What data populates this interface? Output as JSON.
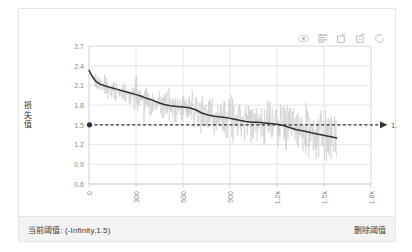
{
  "footer": {
    "threshold_label": "当前阈值: (-Infinity,1.5)",
    "delete_action": "删除阈值"
  },
  "toolbox": {
    "icons": [
      {
        "name": "data-zoom-eye-icon",
        "title": "区域缩放"
      },
      {
        "name": "data-view-icon",
        "title": "数据视图"
      },
      {
        "name": "zoom-in-box-icon",
        "title": "区域缩放"
      },
      {
        "name": "zoom-out-box-icon",
        "title": "区域缩放还原"
      },
      {
        "name": "restore-icon",
        "title": "还原"
      }
    ]
  },
  "chart_data": {
    "type": "line",
    "title": "",
    "xlabel": "",
    "ylabel": "损失值",
    "xlim": [
      0,
      1800
    ],
    "ylim": [
      0.6,
      2.7
    ],
    "grid": true,
    "legend_position": "none",
    "y_ticks": [
      "0.6",
      "0.9",
      "1.2",
      "1.5",
      "1.8",
      "2.1",
      "2.4",
      "2.7"
    ],
    "y_tick_values": [
      0.6,
      0.9,
      1.2,
      1.5,
      1.8,
      2.1,
      2.4,
      2.7
    ],
    "x_ticks": [
      "0",
      "300",
      "600",
      "900",
      "1.2k",
      "1.5k",
      "1.8k"
    ],
    "x_tick_values": [
      0,
      300,
      600,
      900,
      1200,
      1500,
      1800
    ],
    "annotations": [
      {
        "name": "threshold-line",
        "type": "horizontal-marker-line",
        "value": 1.5,
        "label": "1.5",
        "style": "dashed",
        "color": "#333333",
        "start_marker": "dot",
        "end_marker": "arrow"
      }
    ],
    "series": [
      {
        "name": "raw-loss",
        "color": "#cfcfcf",
        "type": "line",
        "x_start": 0,
        "x_end": 1580,
        "sample_count": 790,
        "values_envelope_high": [
          2.33,
          2.36,
          2.3,
          2.22,
          2.18,
          2.3,
          2.1,
          2.05,
          2.2,
          2.12,
          2.02,
          2.16,
          2.05,
          1.98,
          2.1,
          2.28,
          2.04,
          1.96,
          2.08,
          1.95,
          2.0,
          1.92,
          2.04,
          1.9,
          1.98,
          2.26,
          1.94,
          1.88,
          2.02,
          1.9,
          1.96,
          1.86,
          1.98,
          2.08,
          1.88,
          1.84,
          1.96,
          1.86,
          1.92,
          2.02,
          1.84,
          1.8,
          1.94,
          1.86,
          1.9,
          1.98,
          1.82,
          1.78,
          1.92,
          1.84,
          1.88,
          2.0,
          1.8,
          1.76,
          1.9,
          1.82,
          1.86,
          1.94,
          1.78,
          1.74,
          1.88,
          1.8,
          1.84,
          1.92,
          1.76,
          1.72,
          1.86,
          1.78,
          1.82,
          1.9,
          1.74,
          1.7,
          1.84,
          1.76,
          1.8,
          1.88,
          1.72,
          1.68,
          1.82
        ],
        "values_envelope_low": [
          2.3,
          2.05,
          1.95,
          1.8,
          1.86,
          1.7,
          1.75,
          1.62,
          1.7,
          1.58,
          1.66,
          1.52,
          1.62,
          1.48,
          1.58,
          1.44,
          1.56,
          1.4,
          1.54,
          1.38,
          1.5,
          1.34,
          1.48,
          1.32,
          1.46,
          1.3,
          1.44,
          1.28,
          1.42,
          1.26,
          1.4,
          1.24,
          1.38,
          1.22,
          1.36,
          1.2,
          1.34,
          1.18,
          1.32,
          1.16,
          1.3,
          1.14,
          1.28,
          1.12,
          1.26,
          1.1,
          1.24,
          1.08,
          1.22,
          1.06,
          1.2,
          1.04,
          1.18,
          1.02,
          1.16,
          1.0,
          1.14,
          0.99,
          1.12,
          0.98,
          1.1,
          0.97,
          1.08,
          0.96,
          1.06,
          0.95,
          1.04,
          0.94,
          1.02,
          0.93,
          1.0,
          0.92,
          0.99,
          0.91,
          0.98,
          0.9,
          0.97,
          0.9,
          0.96
        ]
      },
      {
        "name": "smoothed-loss",
        "color": "#333333",
        "type": "line",
        "x": [
          0,
          20,
          45,
          70,
          95,
          120,
          150,
          180,
          210,
          240,
          270,
          300,
          330,
          360,
          400,
          440,
          480,
          520,
          560,
          600,
          640,
          680,
          720,
          760,
          800,
          840,
          880,
          920,
          960,
          1000,
          1040,
          1080,
          1120,
          1160,
          1200,
          1240,
          1280,
          1320,
          1360,
          1400,
          1440,
          1480,
          1520,
          1560,
          1580
        ],
        "values": [
          2.33,
          2.24,
          2.16,
          2.12,
          2.1,
          2.08,
          2.06,
          2.04,
          2.02,
          2.0,
          1.98,
          1.96,
          1.94,
          1.91,
          1.88,
          1.84,
          1.81,
          1.79,
          1.78,
          1.77,
          1.76,
          1.73,
          1.68,
          1.65,
          1.63,
          1.62,
          1.61,
          1.59,
          1.57,
          1.55,
          1.54,
          1.54,
          1.53,
          1.52,
          1.51,
          1.49,
          1.46,
          1.43,
          1.41,
          1.39,
          1.37,
          1.35,
          1.33,
          1.31,
          1.3
        ]
      }
    ]
  }
}
